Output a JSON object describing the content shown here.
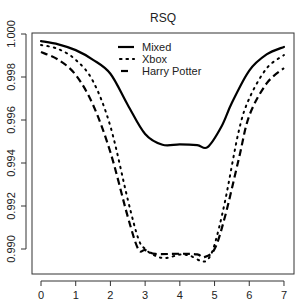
{
  "chart_data": {
    "type": "line",
    "title": "RSQ",
    "xlabel": "",
    "ylabel": "",
    "xlim": [
      -0.28,
      7.3
    ],
    "ylim": [
      0.98893,
      1.0002
    ],
    "x_ticks": [
      0,
      1,
      2,
      3,
      4,
      5,
      6,
      7
    ],
    "x_tick_labels": [
      "0",
      "1",
      "2",
      "3",
      "4",
      "5",
      "6",
      "7"
    ],
    "y_ticks": [
      0.99,
      0.992,
      0.994,
      0.996,
      0.998,
      1.0
    ],
    "y_tick_labels": [
      "0.990",
      "0.992",
      "0.994",
      "0.996",
      "0.998",
      "1.000"
    ],
    "grid": false,
    "legend_position": "top-center",
    "series": [
      {
        "name": "Mixed",
        "style": "solid",
        "color": "#000000",
        "x": [
          0,
          0.5,
          1,
          1.5,
          2,
          2.5,
          3,
          3.5,
          4,
          4.5,
          4.8,
          5.2,
          5.5,
          6,
          6.5,
          7
        ],
        "values": [
          0.99967,
          0.99952,
          0.99925,
          0.9988,
          0.99815,
          0.9967,
          0.99535,
          0.99485,
          0.99487,
          0.99483,
          0.99474,
          0.9957,
          0.9968,
          0.9983,
          0.99905,
          0.9994
        ]
      },
      {
        "name": "Xbox",
        "style": "dotted",
        "color": "#000000",
        "x": [
          0,
          0.5,
          1,
          1.5,
          2,
          2.5,
          2.8,
          3,
          3.3,
          3.6,
          4,
          4.3,
          4.6,
          4.8,
          5,
          5.3,
          5.7,
          6,
          6.5,
          7
        ],
        "values": [
          0.99949,
          0.9993,
          0.9988,
          0.9978,
          0.9957,
          0.9923,
          0.9905,
          0.99,
          0.98968,
          0.98958,
          0.98974,
          0.98968,
          0.98945,
          0.9895,
          0.9902,
          0.9922,
          0.9955,
          0.997,
          0.9984,
          0.99902
        ]
      },
      {
        "name": "Harry Potter",
        "style": "dashed",
        "color": "#000000",
        "x": [
          0,
          0.5,
          1,
          1.5,
          2,
          2.5,
          2.8,
          3,
          3.3,
          4,
          4.5,
          4.7,
          5,
          5.3,
          5.7,
          6,
          6.5,
          7
        ],
        "values": [
          0.99916,
          0.9988,
          0.9981,
          0.9967,
          0.9945,
          0.9915,
          0.99,
          0.98995,
          0.98977,
          0.98978,
          0.98975,
          0.98962,
          0.99,
          0.9915,
          0.9942,
          0.9962,
          0.9977,
          0.99842
        ]
      }
    ]
  },
  "layout": {
    "plot_left": 32,
    "plot_right": 294,
    "plot_top": 33,
    "plot_bottom": 274,
    "x0_px": 41,
    "x_unit_px": 34.71,
    "y_ref_value": 1.0,
    "y_ref_px": 34,
    "y_px_per_unit": 21500
  }
}
